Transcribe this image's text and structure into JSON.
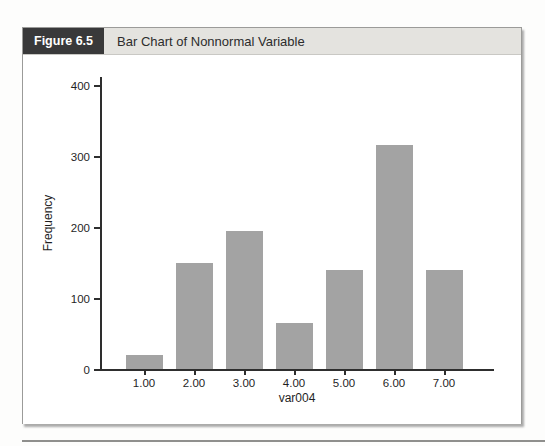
{
  "figure": {
    "label": "Figure 6.5",
    "title": "Bar Chart of Nonnormal Variable"
  },
  "colors": {
    "bar": "#a3a3a3",
    "axis": "#2e2e2e",
    "figure_label_bg": "#39393a",
    "figure_header_bg": "#e4e3df",
    "text": "#1f1f1f"
  },
  "chart_data": {
    "type": "bar",
    "categories": [
      "1.00",
      "2.00",
      "3.00",
      "4.00",
      "5.00",
      "6.00",
      "7.00"
    ],
    "values": [
      20,
      150,
      195,
      65,
      140,
      315,
      140
    ],
    "title": "Bar Chart of Nonnormal Variable",
    "xlabel": "var004",
    "ylabel": "Frequency",
    "yticks": [
      0,
      100,
      200,
      300,
      400
    ],
    "ylim": [
      0,
      420
    ],
    "grid": false,
    "legend": "none"
  }
}
